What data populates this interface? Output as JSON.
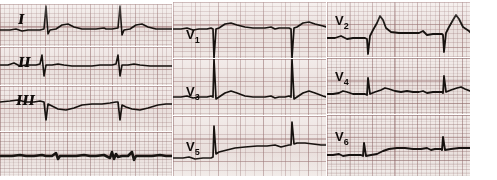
{
  "document": {
    "kind": "12-lead electrocardiogram strip printout",
    "paper_color": "#efe7e4",
    "grid_color": "#96736f",
    "trace_color": "#17120f",
    "columns": 3,
    "rows_per_column": 3
  },
  "leads": {
    "I": {
      "label": "I",
      "label_kind": "roman"
    },
    "II": {
      "label": "II",
      "label_kind": "roman"
    },
    "III": {
      "label": "III",
      "label_kind": "roman"
    },
    "V1": {
      "label": "V",
      "subscript": "1"
    },
    "V2": {
      "label": "V",
      "subscript": "2"
    },
    "V3": {
      "label": "V",
      "subscript": "3"
    },
    "V4": {
      "label": "V",
      "subscript": "4"
    },
    "V5": {
      "label": "V",
      "subscript": "5"
    },
    "V6": {
      "label": "V",
      "subscript": "6"
    },
    "rhythm": {
      "label": ""
    }
  },
  "chart_data": {
    "type": "line",
    "title": "",
    "xlabel": "",
    "ylabel": "",
    "grid": true,
    "legend": "none",
    "paper_speed_note": "",
    "series": [
      {
        "name": "I",
        "panel": "panel-I",
        "beats": 3,
        "morphology": "tall narrow upright R spikes with rounded T waves, isoelectric baseline",
        "path": "M0,26 L10,26 L16,25 L22,27 L28,26 L40,26 L44,25 L46,2 L48,30 L50,26 L56,25 L62,21 L68,20 L74,23 L82,25 L96,25 L104,24 L106,25 L112,25 L118,24 L120,2 L122,31 L124,26 L130,25 L136,21 L142,20 L148,23 L156,25 L166,25 L172,25",
        "stroke_width": 1.6
      },
      {
        "name": "II",
        "panel": "panel-II",
        "beats": 3,
        "morphology": "low amplitude; small biphasic QRS with slight negative deflection, flat T",
        "path": "M0,18 L8,18 L14,16 L20,19 L26,18 L36,18 L40,17 L42,8 L44,29 L46,18 L52,18 L58,17 L64,18 L72,19 L80,19 L92,19 L100,18 L106,18 L112,18 L116,17 L118,8 L120,29 L122,18 L128,18 L134,17 L140,18 L150,19 L160,19 L172,19",
        "stroke_width": 1.6
      },
      {
        "name": "III",
        "panel": "panel-III",
        "beats": 3,
        "morphology": "negative QS complexes with deep downward spikes and inverted T troughs",
        "path": "M0,16 L10,15 L18,14 L26,16 L34,16 L40,15 L44,16 L46,34 L48,18 L52,20 L58,23 L66,24 L74,22 L82,19 L92,18 L102,18 L110,17 L116,16 L118,16 L120,34 L122,19 L126,21 L132,23 L140,24 L148,22 L158,19 L166,18 L172,18",
        "stroke_width": 1.7
      },
      {
        "name": "rhythm",
        "panel": "panel-rhythm",
        "beats": 3,
        "morphology": "thick compressed rhythm strip, nearly flat dark baseline with small sharp spikes",
        "path": "M0,24 L12,24 L20,23 L26,24 L34,24 L42,23 L46,24 L52,24 L56,21 L58,27 L60,24 L68,24 L76,24 L84,23 L90,24 L96,24 L104,23 L110,26 L112,20 L114,27 L116,22 L118,25 L122,24 L128,24 L132,20 L134,28 L136,24 L144,24 L152,24 L160,23 L166,24 L172,24",
        "stroke_width": 2.6
      },
      {
        "name": "V1",
        "panel": "panel-V1",
        "beats": 3,
        "morphology": "deep narrow downward QS spikes extending below panel, small r, flat ST",
        "path": "M0,27 L8,27 L14,26 L20,28 L26,27 L34,27 L38,26 L40,27 L41,56 L43,27 L46,26 L52,22 L58,21 L64,23 L72,25 L80,26 L92,26 L98,25 L102,27 L106,26 L112,26 L116,26 L118,27 L119,56 L121,26 L124,25 L130,21 L136,20 L142,22 L150,24 L153,25",
        "stroke_width": 1.7
      },
      {
        "name": "V3",
        "panel": "panel-V3",
        "beats": 3,
        "morphology": "tall R spikes rising above the panel, ST segment slightly elevated, rounded T",
        "path": "M0,38 L8,38 L14,37 L20,39 L26,38 L34,38 L38,37 L40,38 L41,0 L43,40 L46,38 L52,34 L58,32 L64,34 L72,37 L80,38 L92,38 L98,37 L102,39 L106,38 L112,38 L116,37 L118,38 L119,0 L121,40 L124,38 L130,34 L136,32 L142,34 L150,37 L153,38",
        "stroke_width": 1.7
      },
      {
        "name": "V5",
        "panel": "panel-V5",
        "beats": 3,
        "morphology": "upsloping baseline with tall thin upward R spikes, broad gentle T waves",
        "path": "M0,42 L10,42 L16,41 L22,43 L30,42 L38,42 L40,41 L41,10 L43,38 L46,36 L54,34 L62,32 L72,31 L84,30 L94,30 L102,29 L108,31 L112,30 L116,29 L118,29 L119,6 L121,28 L124,27 L132,27 L140,28 L148,29 L153,29",
        "stroke_width": 1.7
      },
      {
        "name": "V2",
        "panel": "panel-V2",
        "beats": 3,
        "morphology": "marked ST elevation with tall peaked coved T waves, small preceding r wave",
        "path": "M0,36 L8,36 L14,34 L20,37 L26,36 L34,36 L38,36 L40,37 L41,52 L43,34 L46,28 L50,21 L53,14 L56,18 L59,26 L64,30 L72,31 L82,31 L92,31 L96,29 L100,33 L106,32 L112,32 L115,32 L116,33 L117,50 L119,31 L122,25 L126,18 L129,13 L132,17 L136,25 L142,29 L143,30",
        "stroke_width": 1.8
      },
      {
        "name": "V4",
        "panel": "panel-V4",
        "beats": 3,
        "morphology": "fuzzy noisy trace, small rounded R bumps on a near-flat baseline",
        "path": "M0,36 L6,36 L12,35 L16,33 L20,34 L26,36 L34,36 L38,36 L40,37 L41,20 L43,36 L48,34 L54,32 L58,30 L62,31 L68,33 L74,34 L80,33 L86,34 L92,34 L96,33 L100,35 L106,34 L112,34 L115,34 L116,35 L117,18 L119,34 L124,32 L130,30 L134,29 L138,31 L143,33",
        "stroke_width": 1.8
      },
      {
        "name": "V6",
        "panel": "panel-V6",
        "beats": 3,
        "morphology": "noisy low-amplitude trace with gentle rolling elevation, small spikes at beat onsets",
        "path": "M0,40 L6,40 L12,39 L16,41 L22,40 L30,40 L34,40 L36,41 L37,28 L39,41 L44,40 L50,39 L56,36 L62,34 L70,33 L78,33 L86,34 L94,34 L100,33 L104,35 L108,34 L112,34 L114,34 L115,35 L116,22 L118,35 L124,34 L132,33 L140,33 L143,33",
        "stroke_width": 1.9
      }
    ]
  }
}
